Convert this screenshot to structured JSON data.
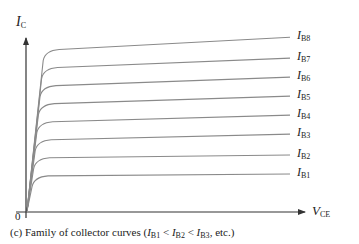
{
  "chart_data": {
    "type": "line",
    "title": "",
    "caption": {
      "prefix": "(c) Family of collector curves (",
      "terms": [
        {
          "main": "I",
          "sub": "B1"
        },
        {
          "main": "I",
          "sub": "B2"
        },
        {
          "main": "I",
          "sub": "B3"
        }
      ],
      "separator": " < ",
      "suffix": ", etc.)"
    },
    "xlabel": {
      "main": "V",
      "sub": "CE"
    },
    "ylabel": {
      "main": "I",
      "sub": "C"
    },
    "origin_label": "0",
    "grid": false,
    "axis_ticks": false,
    "series": [
      {
        "name": "IB1",
        "label_main": "I",
        "label_sub": "B1",
        "sat_level": 0.185,
        "end_level": 0.2
      },
      {
        "name": "IB2",
        "label_main": "I",
        "label_sub": "B2",
        "sat_level": 0.28,
        "end_level": 0.3
      },
      {
        "name": "IB3",
        "label_main": "I",
        "label_sub": "B3",
        "sat_level": 0.375,
        "end_level": 0.41
      },
      {
        "name": "IB4",
        "label_main": "I",
        "label_sub": "B4",
        "sat_level": 0.47,
        "end_level": 0.51
      },
      {
        "name": "IB5",
        "label_main": "I",
        "label_sub": "B5",
        "sat_level": 0.565,
        "end_level": 0.61
      },
      {
        "name": "IB6",
        "label_main": "I",
        "label_sub": "B6",
        "sat_level": 0.66,
        "end_level": 0.71
      },
      {
        "name": "IB7",
        "label_main": "I",
        "label_sub": "B7",
        "sat_level": 0.755,
        "end_level": 0.81
      },
      {
        "name": "IB8",
        "label_main": "I",
        "label_sub": "B8",
        "sat_level": 0.85,
        "end_level": 0.92
      }
    ],
    "colors": {
      "curve": "#8a8a8a",
      "axis": "#333333",
      "text": "#222222"
    }
  }
}
